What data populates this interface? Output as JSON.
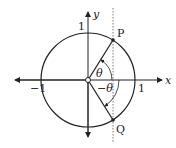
{
  "diagram": {
    "axes": {
      "x_label": "x",
      "y_label": "y",
      "origin_label": "O",
      "tick_pos_x": "1",
      "tick_neg_x": "−1",
      "tick_pos_y": "1"
    },
    "points": [
      {
        "label": "P",
        "angle": "θ"
      },
      {
        "label": "Q",
        "angle": "−θ"
      }
    ],
    "angle_labels": {
      "upper": "θ",
      "lower": "−θ"
    },
    "colors": {
      "stroke": "#222222",
      "background": "#ffffff"
    }
  }
}
